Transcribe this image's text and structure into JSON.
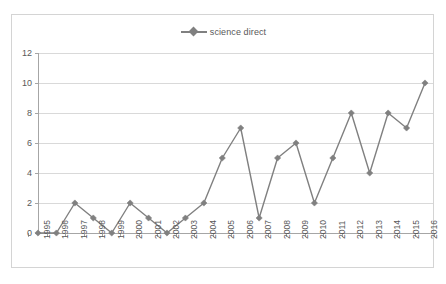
{
  "chart_data": {
    "type": "line",
    "title": "",
    "subtitle": "",
    "xlabel": "",
    "ylabel": "",
    "categories": [
      "1995",
      "1996",
      "1997",
      "1998",
      "1999",
      "2000",
      "2001",
      "2002",
      "2003",
      "2004",
      "2005",
      "2006",
      "2007",
      "2008",
      "2009",
      "2010",
      "2011",
      "2012",
      "2013",
      "2014",
      "2015",
      "2016"
    ],
    "series": [
      {
        "name": "science direct",
        "values": [
          0,
          0,
          2,
          1,
          0,
          2,
          1,
          0,
          1,
          2,
          5,
          7,
          1,
          5,
          6,
          2,
          5,
          8,
          4,
          8,
          7,
          10
        ]
      }
    ],
    "ylim": [
      0,
      12
    ],
    "y_ticks": [
      0,
      2,
      4,
      6,
      8,
      10,
      12
    ],
    "y_tick_labels": [
      "0",
      "2",
      "4",
      "6",
      "8",
      "10",
      "12"
    ],
    "grid": "horizontal",
    "legend_position": "top-center",
    "marker": "diamond",
    "colors": {
      "series": "#808080",
      "gridline": "#d9d9d9",
      "axis": "#a6a6a6",
      "text": "#595959",
      "border": "#d4d4d4",
      "background": "#ffffff"
    }
  },
  "legend": {
    "entries": [
      {
        "label": "science direct",
        "marker": "diamond-marker"
      }
    ]
  }
}
